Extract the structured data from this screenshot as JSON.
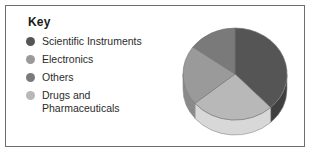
{
  "figure": {
    "border_color": "#6e6e6e",
    "background": "#ffffff"
  },
  "legend": {
    "title": "Key",
    "items": [
      {
        "label": "Scientific Instruments",
        "color": "#555555"
      },
      {
        "label": "Electronics",
        "color": "#9a9a9a"
      },
      {
        "label": "Others",
        "color": "#7a7a7a"
      },
      {
        "label": "Drugs and\nPharmaceuticals",
        "color": "#b8b8b8"
      }
    ]
  },
  "chart_data": {
    "type": "pie",
    "title": "",
    "three_d": true,
    "legend_position": "left",
    "labels": [
      "Scientific Instruments",
      "Drugs and Pharmaceuticals",
      "Electronics",
      "Others"
    ],
    "values": [
      38,
      26,
      21,
      15
    ],
    "colors": [
      "#555555",
      "#b8b8b8",
      "#9a9a9a",
      "#7a7a7a"
    ],
    "side_colors": [
      "#3f3f3f",
      "#d8d8d8",
      "#8a8a8a",
      "#6a6a6a"
    ],
    "start_angle": 0,
    "direction": "clockwise",
    "units": "percent"
  }
}
